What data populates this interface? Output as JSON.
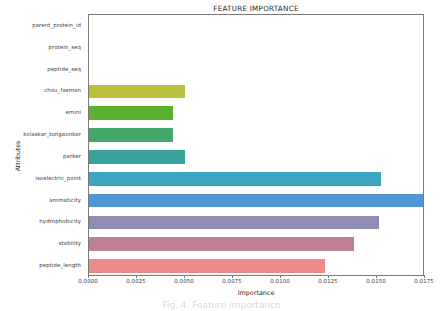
{
  "chart_data": {
    "type": "bar",
    "orientation": "horizontal",
    "title": "FEATURE IMPORTANCE",
    "xlabel": "Importance",
    "ylabel": "Attributes",
    "xlim": [
      0.0,
      0.0175
    ],
    "xticks": [
      "0.0000",
      "0.0025",
      "0.0050",
      "0.0075",
      "0.0100",
      "0.0125",
      "0.0150",
      "0.0175"
    ],
    "xtick_values": [
      0.0,
      0.0025,
      0.005,
      0.0075,
      0.01,
      0.0125,
      0.015,
      0.0175
    ],
    "grid": false,
    "legend": "none",
    "categories": [
      "parent_protein_id",
      "protein_seq",
      "peptide_seq",
      "chou_fasman",
      "emini",
      "kolaskar_tongaonkar",
      "parker",
      "isoelectric_point",
      "aromaticity",
      "hydrophobicity",
      "stability",
      "peptide_length"
    ],
    "values": [
      0.0,
      0.0,
      0.0,
      0.005,
      0.0044,
      0.0044,
      0.005,
      0.0152,
      0.0174,
      0.0151,
      0.0138,
      0.0123
    ],
    "colors": [
      "#b5bd3c",
      "#b5bd3c",
      "#b5bd3c",
      "#b5bd3c",
      "#5fb githubusercontent",
      "#4aa83a",
      "#3f9e6b",
      "#38a0a6",
      "#3aa7c4",
      "#4f97d8",
      "#8f8cb8",
      "#bf7f96",
      "#f08a8a"
    ]
  },
  "caption": {
    "text": "Fig. 4. Feature importance"
  }
}
